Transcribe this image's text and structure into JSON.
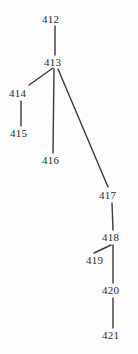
{
  "diagram": {
    "type": "tree",
    "title": "",
    "canvas": {
      "width": 138,
      "height": 354
    },
    "style": {
      "background_color": "#fdfdfd",
      "edge_color": "#3a3a3a",
      "label_color": "#2b2b2b",
      "edge_width": 1.4,
      "font_size_px": 11
    },
    "nodes": [
      {
        "id": "n412",
        "label": "412",
        "x": 52,
        "y": 19,
        "text_left": 42,
        "text_top": 14
      },
      {
        "id": "n413",
        "label": "413",
        "x": 55,
        "y": 62,
        "text_left": 44,
        "text_top": 57
      },
      {
        "id": "n414",
        "label": "414",
        "x": 20,
        "y": 93,
        "text_left": 9,
        "text_top": 88
      },
      {
        "id": "n415",
        "label": "415",
        "x": 21,
        "y": 133,
        "text_left": 10,
        "text_top": 128
      },
      {
        "id": "n416",
        "label": "416",
        "x": 53,
        "y": 160,
        "text_left": 42,
        "text_top": 155
      },
      {
        "id": "n417",
        "label": "417",
        "x": 110,
        "y": 195,
        "text_left": 99,
        "text_top": 190
      },
      {
        "id": "n418",
        "label": "418",
        "x": 113,
        "y": 237,
        "text_left": 102,
        "text_top": 232
      },
      {
        "id": "n419",
        "label": "419",
        "x": 97,
        "y": 260,
        "text_left": 86,
        "text_top": 255
      },
      {
        "id": "n420",
        "label": "420",
        "x": 113,
        "y": 290,
        "text_left": 102,
        "text_top": 285
      },
      {
        "id": "n421",
        "label": "421",
        "x": 113,
        "y": 335,
        "text_left": 102,
        "text_top": 330
      }
    ],
    "edges": [
      {
        "from": "n412",
        "to": "n413",
        "x1": 55,
        "y1": 26,
        "x2": 55,
        "y2": 55,
        "kind": "vertical"
      },
      {
        "from": "n413",
        "to": "n414",
        "x1": 53,
        "y1": 68,
        "x2": 29,
        "y2": 85,
        "kind": "diagonal"
      },
      {
        "from": "n414",
        "to": "n415",
        "x1": 21,
        "y1": 101,
        "x2": 21,
        "y2": 126,
        "kind": "vertical"
      },
      {
        "from": "n413",
        "to": "n416",
        "x1": 54,
        "y1": 69,
        "x2": 53,
        "y2": 153,
        "kind": "vertical"
      },
      {
        "from": "n413",
        "to": "n417",
        "x1": 58,
        "y1": 69,
        "x2": 108,
        "y2": 187,
        "kind": "diagonal"
      },
      {
        "from": "n417",
        "to": "n418",
        "x1": 112,
        "y1": 203,
        "x2": 113,
        "y2": 230,
        "kind": "vertical"
      },
      {
        "from": "n418",
        "to": "n419",
        "x1": 111,
        "y1": 245,
        "x2": 94,
        "y2": 253,
        "kind": "diagonal"
      },
      {
        "from": "n418",
        "to": "n420",
        "x1": 113,
        "y1": 245,
        "x2": 113,
        "y2": 283,
        "kind": "vertical"
      },
      {
        "from": "n420",
        "to": "n421",
        "x1": 113,
        "y1": 298,
        "x2": 113,
        "y2": 328,
        "kind": "vertical"
      }
    ]
  }
}
